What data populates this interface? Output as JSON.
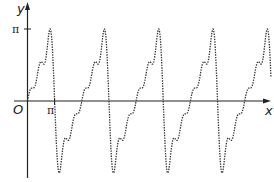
{
  "chart_data": {
    "type": "line",
    "title": "",
    "xlabel": "x",
    "ylabel": "y",
    "origin_label": "O",
    "x_ticks": [
      {
        "value": 3.14159,
        "label": "π"
      }
    ],
    "y_ticks": [
      {
        "value": 3.14159,
        "label": "π"
      }
    ],
    "series": [
      {
        "name": "Fourier partial sum of sawtooth f(x)=x, period 2π",
        "style": "dotted",
        "formula": "S_5(x) = 2·Σ_{k=1..5} (-1)^(k+1) sin(kx)/k",
        "harmonics": 5,
        "x_range": [
          0,
          28.0
        ],
        "approx_points": [
          {
            "x": 0,
            "y": 0
          },
          {
            "x": 1.57,
            "y": 1.6
          },
          {
            "x": 2.8,
            "y": 3.2
          },
          {
            "x": 3.14159,
            "y": 0
          },
          {
            "x": 3.5,
            "y": -3.2
          },
          {
            "x": 4.7,
            "y": -1.6
          },
          {
            "x": 6.283,
            "y": 0
          }
        ],
        "period": 6.283,
        "peaks_near": [
          3.14,
          9.42,
          15.71,
          21.99
        ],
        "zero_crossings": [
          0,
          3.14159,
          6.283,
          9.425,
          12.566,
          15.708,
          18.85,
          21.99,
          25.13
        ]
      }
    ],
    "xlim": [
      -0.15,
      28.5
    ],
    "ylim": [
      -3.5,
      4.0
    ],
    "grid": false,
    "legend": "none"
  },
  "labels": {
    "y_axis": "y",
    "x_axis": "x",
    "origin": "O",
    "pi_x": "π",
    "pi_y": "π"
  }
}
